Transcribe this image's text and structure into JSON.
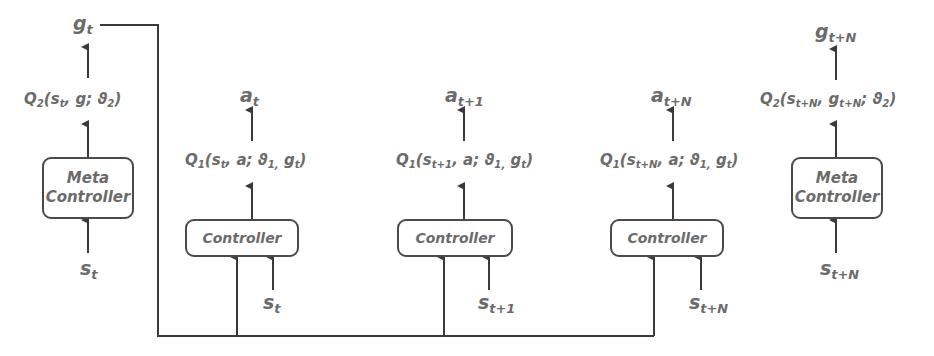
{
  "diagram": {
    "colors": {
      "line": "#3a3a3a",
      "text": "#6b6b6b",
      "background": "#ffffff"
    },
    "left_meta": {
      "output": {
        "base": "g",
        "sub": "t"
      },
      "q_function": {
        "pre": "Q",
        "qsub": "2",
        "args_html": "(s<sub>t</sub>, g; ϑ<sub>2</sub>)",
        "text": "Q2(st, g; ϑ2)"
      },
      "box_line1": "Meta",
      "box_line2": "Controller",
      "input": {
        "base": "s",
        "sub": "t"
      }
    },
    "controllers": [
      {
        "output": {
          "base": "a",
          "sub": "t"
        },
        "q_function": {
          "text": "Q1(st, a; ϑ1, gt)"
        },
        "box_label": "Controller",
        "input": {
          "base": "s",
          "sub": "t"
        }
      },
      {
        "output": {
          "base": "a",
          "sub": "t+1"
        },
        "q_function": {
          "text": "Q1(st+1, a; ϑ1, gt)"
        },
        "box_label": "Controller",
        "input": {
          "base": "s",
          "sub": "t+1"
        }
      },
      {
        "output": {
          "base": "a",
          "sub": "t+N"
        },
        "q_function": {
          "text": "Q1(st+N, a; ϑ1, gt)"
        },
        "box_label": "Controller",
        "input": {
          "base": "s",
          "sub": "t+N"
        }
      }
    ],
    "right_meta": {
      "output": {
        "base": "g",
        "sub": "t+N"
      },
      "q_function": {
        "text": "Q2(st+N, gt+N; ϑ2)"
      },
      "box_line1": "Meta",
      "box_line2": "Controller",
      "input": {
        "base": "s",
        "sub": "t+N"
      }
    },
    "goal_feed": "g_t is routed to every Controller via a shared bus line"
  }
}
